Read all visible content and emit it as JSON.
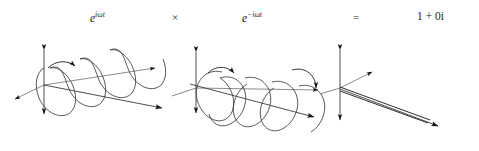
{
  "figure": {
    "title_equation": "e^{i omega t} x e^{-i omega t} = 1 + 0i",
    "background_color": "#ffffff",
    "line_color": "#2e2e2e",
    "axis_color": "#6f6f6f",
    "arrow_color": "#111111",
    "width": 479,
    "height": 151
  },
  "equation": {
    "term1": {
      "base": "e",
      "exponent": "iωt",
      "label": "e^{iωt}"
    },
    "operator_multiply": "×",
    "term2": {
      "base": "e",
      "exponent": "−iωt",
      "label": "e^{−iωt}"
    },
    "operator_equals": "=",
    "result": "1 + 0i",
    "result_real": "1",
    "result_plus": "+",
    "result_imag": "0i"
  },
  "diagrams": [
    {
      "name": "left-circular-helix",
      "handedness": "left-handed",
      "turns": 4,
      "rotation_arrow": "counterclockwise",
      "axes": [
        "vertical-double-arrow",
        "diagonal-depth-axis",
        "horizontal-propagation-axis"
      ],
      "caption": "e^{iωt}"
    },
    {
      "name": "right-circular-helix",
      "handedness": "right-handed",
      "turns": 4,
      "rotation_arrow": "clockwise",
      "axes": [
        "vertical-double-arrow",
        "diagonal-depth-axis",
        "horizontal-propagation-axis"
      ],
      "caption": "e^{−iωt}"
    },
    {
      "name": "linear-degenerate-line",
      "handedness": "none",
      "turns": 0,
      "rotation_arrow": "none",
      "axes": [
        "vertical-double-arrow",
        "diagonal-depth-axis",
        "horizontal-propagation-axis"
      ],
      "caption": "1 + 0i"
    }
  ]
}
